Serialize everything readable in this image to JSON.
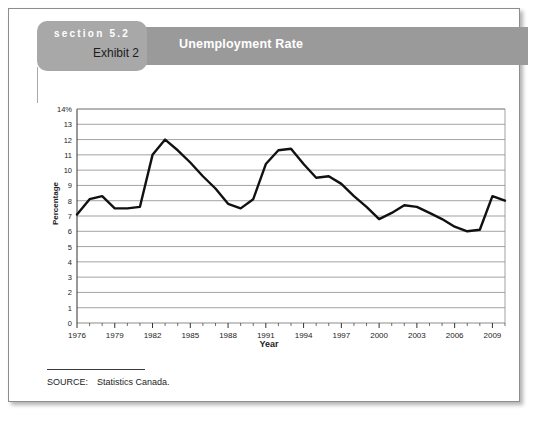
{
  "header": {
    "section_label": "section 5.2",
    "exhibit_label": "Exhibit 2",
    "banner_title": "Unemployment Rate",
    "banner_color": "#9a9a9a",
    "tab_color": "#a8a8a8"
  },
  "source": {
    "label": "SOURCE:",
    "text": "Statistics Canada."
  },
  "chart_data": {
    "type": "line",
    "title": "Unemployment Rate",
    "xlabel": "Year",
    "ylabel": "Percentage",
    "xlim": [
      1976,
      2010
    ],
    "ylim": [
      0,
      14
    ],
    "grid": true,
    "legend": "none",
    "line_color": "#111111",
    "line_width": 2.4,
    "y_ticks": [
      0,
      1,
      2,
      3,
      4,
      5,
      6,
      7,
      8,
      9,
      10,
      11,
      12,
      13,
      14
    ],
    "y_tick_labels": [
      "0",
      "1",
      "2",
      "3",
      "4",
      "5",
      "6",
      "7",
      "8",
      "9",
      "10",
      "11",
      "12",
      "13",
      "14%"
    ],
    "x_major_ticks": [
      1976,
      1979,
      1982,
      1985,
      1988,
      1991,
      1994,
      1997,
      2000,
      2003,
      2006,
      2009
    ],
    "x_major_labels": [
      "1976",
      "1979",
      "1982",
      "1985",
      "1988",
      "1991",
      "1994",
      "1997",
      "2000",
      "2003",
      "2006",
      "2009"
    ],
    "x_minor_tick_interval": 1,
    "series": [
      {
        "name": "Unemployment Rate",
        "x": [
          1976,
          1977,
          1978,
          1979,
          1980,
          1981,
          1982,
          1983,
          1984,
          1985,
          1986,
          1987,
          1988,
          1989,
          1990,
          1991,
          1992,
          1993,
          1994,
          1995,
          1996,
          1997,
          1998,
          1999,
          2000,
          2001,
          2002,
          2003,
          2004,
          2005,
          2006,
          2007,
          2008,
          2009,
          2010
        ],
        "values": [
          7.1,
          8.1,
          8.3,
          7.5,
          7.5,
          7.6,
          11.0,
          12.0,
          11.3,
          10.5,
          9.6,
          8.8,
          7.8,
          7.5,
          8.1,
          10.4,
          11.3,
          11.4,
          10.4,
          9.5,
          9.6,
          9.1,
          8.3,
          7.6,
          6.8,
          7.2,
          7.7,
          7.6,
          7.2,
          6.8,
          6.3,
          6.0,
          6.1,
          8.3,
          8.0
        ]
      }
    ]
  }
}
